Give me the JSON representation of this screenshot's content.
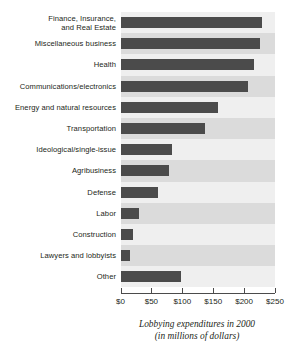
{
  "chart_data": {
    "type": "bar",
    "orientation": "horizontal",
    "title": "",
    "subtitle": "",
    "caption_line1": "Lobbying expenditures in 2000",
    "caption_line2": "(in millions of dollars)",
    "xlabel": "Lobbying expenditures in 2000 (in millions of dollars)",
    "ylabel": "",
    "xlim": [
      0,
      250
    ],
    "xticks": [
      0,
      50,
      100,
      150,
      200,
      250
    ],
    "xticklabels": [
      "$0",
      "$50",
      "$100",
      "$150",
      "$200",
      "$250"
    ],
    "grid": false,
    "legend": "none",
    "bar_color": "#4b4b4b",
    "band_color_light": "#efefef",
    "band_color_dark": "#dbdbdb",
    "categories": [
      "Finance, Insurance, and Real Estate",
      "Miscellaneous business",
      "Health",
      "Communications/electronics",
      "Energy and natural resources",
      "Transportation",
      "Ideological/single-issue",
      "Agribusiness",
      "Defense",
      "Labor",
      "Construction",
      "Lawyers and lobbyists",
      "Other"
    ],
    "values": [
      229,
      226,
      216,
      207,
      158,
      136,
      84,
      79,
      60,
      30,
      21,
      15,
      98
    ],
    "rows": [
      {
        "label_line1": "Finance, Insurance,",
        "label_line2": "and Real Estate",
        "value": 229
      },
      {
        "label_line1": "Miscellaneous business",
        "label_line2": "",
        "value": 226
      },
      {
        "label_line1": "Health",
        "label_line2": "",
        "value": 216
      },
      {
        "label_line1": "Communications/electronics",
        "label_line2": "",
        "value": 207
      },
      {
        "label_line1": "Energy and natural resources",
        "label_line2": "",
        "value": 158
      },
      {
        "label_line1": "Transportation",
        "label_line2": "",
        "value": 136
      },
      {
        "label_line1": "Ideological/single-issue",
        "label_line2": "",
        "value": 84
      },
      {
        "label_line1": "Agribusiness",
        "label_line2": "",
        "value": 79
      },
      {
        "label_line1": "Defense",
        "label_line2": "",
        "value": 60
      },
      {
        "label_line1": "Labor",
        "label_line2": "",
        "value": 30
      },
      {
        "label_line1": "Construction",
        "label_line2": "",
        "value": 21
      },
      {
        "label_line1": "Lawyers and lobbyists",
        "label_line2": "",
        "value": 15
      },
      {
        "label_line1": "Other",
        "label_line2": "",
        "value": 98
      }
    ]
  }
}
